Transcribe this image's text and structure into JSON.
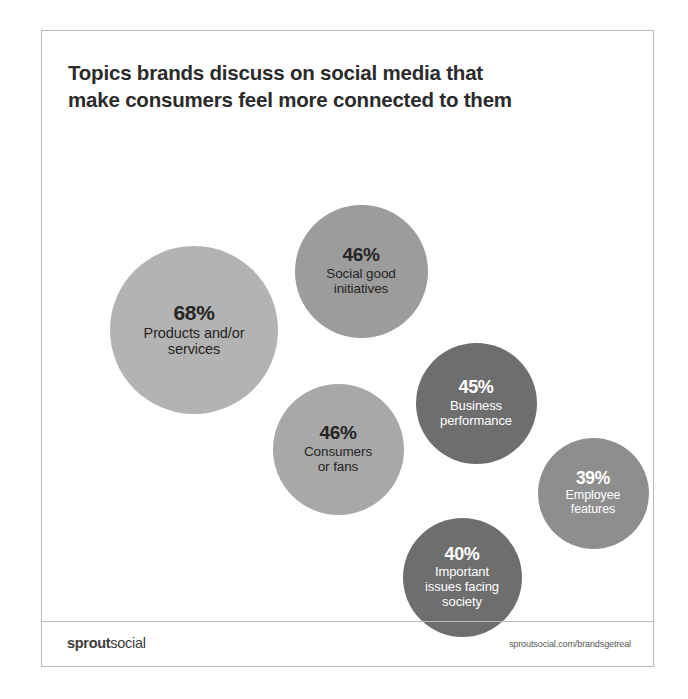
{
  "card": {
    "title_line_1": "Topics brands discuss on social media that",
    "title_line_2": "make consumers feel more connected to them"
  },
  "footer": {
    "logo_bold": "sprout",
    "logo_regular": "social",
    "url": "sproutsocial.com/brandsgetreal"
  },
  "chart_data": {
    "type": "bubble",
    "title": "Topics brands discuss on social media that make consumers feel more connected to them",
    "xlabel": "",
    "ylabel": "",
    "grid": false,
    "legend": "none",
    "unit": "%",
    "categories": [
      "Products and/or services",
      "Social good initiatives",
      "Consumers or fans",
      "Business performance",
      "Important issues facing society",
      "Employee features"
    ],
    "values": [
      68,
      46,
      46,
      45,
      40,
      39
    ],
    "bubbles": [
      {
        "id": "products-services",
        "value": 68,
        "value_text": "68%",
        "label": "Products and/or\nservices",
        "label_line_1": "Products and/or",
        "label_line_2": "services",
        "color": "#b3b3b3",
        "text_color": "#252525",
        "cx": 152,
        "cy": 195,
        "d": 168,
        "value_font": 21,
        "label_font": 14.5
      },
      {
        "id": "social-good-initiatives",
        "value": 46,
        "value_text": "46%",
        "label": "Social good\ninitiatives",
        "label_line_1": "Social good",
        "label_line_2": "initiatives",
        "color": "#9c9c9c",
        "text_color": "#252525",
        "cx": 319,
        "cy": 136,
        "d": 133,
        "value_font": 19,
        "label_font": 13.5
      },
      {
        "id": "consumers-or-fans",
        "value": 46,
        "value_text": "46%",
        "label": "Consumers\nor fans",
        "label_line_1": "Consumers",
        "label_line_2": "or fans",
        "color": "#a8a8a8",
        "text_color": "#252525",
        "cx": 296,
        "cy": 314,
        "d": 131,
        "value_font": 19,
        "label_font": 13.5
      },
      {
        "id": "business-performance",
        "value": 45,
        "value_text": "45%",
        "label": "Business\nperformance",
        "label_line_1": "Business",
        "label_line_2": "performance",
        "color": "#6e6e6e",
        "text_color": "#ffffff",
        "cx": 434,
        "cy": 268,
        "d": 121,
        "value_font": 18,
        "label_font": 13
      },
      {
        "id": "important-issues-facing-society",
        "value": 40,
        "value_text": "40%",
        "label": "Important\nissues facing\nsociety",
        "label_line_1": "Important",
        "label_line_2": "issues facing",
        "label_line_3": "society",
        "color": "#6e6e6e",
        "text_color": "#ffffff",
        "cx": 420,
        "cy": 442,
        "d": 119,
        "value_font": 18,
        "label_font": 13
      },
      {
        "id": "employee-features",
        "value": 39,
        "value_text": "39%",
        "label": "Employee\nfeatures",
        "label_line_1": "Employee",
        "label_line_2": "features",
        "color": "#8e8e8e",
        "text_color": "#ffffff",
        "cx": 551,
        "cy": 358,
        "d": 111,
        "value_font": 17.5,
        "label_font": 12.5
      }
    ]
  }
}
